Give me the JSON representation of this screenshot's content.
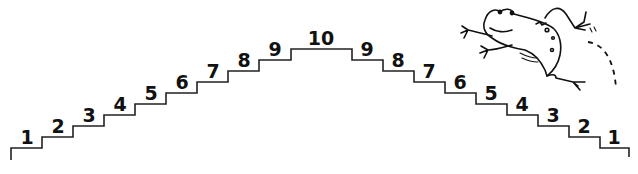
{
  "diagram": {
    "title": "",
    "type": "number-staircase",
    "ascending_labels": [
      "1",
      "2",
      "3",
      "4",
      "5",
      "6",
      "7",
      "8",
      "9"
    ],
    "peak_label": "10",
    "descending_labels": [
      "9",
      "8",
      "7",
      "6",
      "5",
      "4",
      "3",
      "2",
      "1"
    ],
    "illustration": "frog-jumping-icon",
    "colors": {
      "line": "#222222",
      "text": "#111111",
      "background": "#ffffff"
    }
  }
}
